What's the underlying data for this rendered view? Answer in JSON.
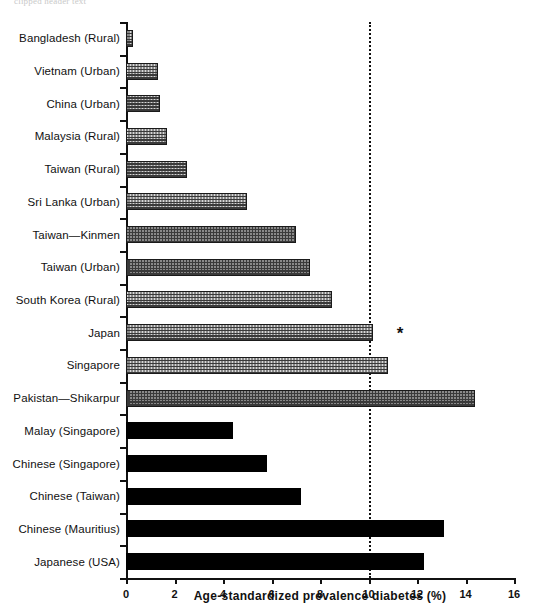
{
  "top_artifact": "clipped header text",
  "chart_data": {
    "type": "bar",
    "orientation": "horizontal",
    "title": "",
    "xlabel": "Age-standardized prevalence diabetes (%)",
    "ylabel": "",
    "xlim": [
      0,
      16
    ],
    "xticks": [
      0,
      2,
      4,
      6,
      8,
      10,
      12,
      14,
      16
    ],
    "xtick_labels": [
      "0",
      "2",
      "4",
      "6",
      "8",
      "10",
      "12",
      "14",
      "16"
    ],
    "grid": false,
    "legend": null,
    "reference_line": {
      "value": 10,
      "style": "dotted"
    },
    "annotations": [
      {
        "text": "*",
        "category": "Japan",
        "x": 11.3
      }
    ],
    "series": [
      {
        "name": "Asian countries",
        "fill": "hatched",
        "color": "#d8d8d8"
      },
      {
        "name": "Migrant / ethnic Asian populations",
        "fill": "solid",
        "color": "#000000"
      }
    ],
    "categories": [
      "Bangladesh (Rural)",
      "Vietnam (Urban)",
      "China (Urban)",
      "Malaysia (Rural)",
      "Taiwan (Rural)",
      "Sri Lanka (Urban)",
      "Taiwan—Kinmen",
      "Taiwan (Urban)",
      "South Korea (Rural)",
      "Japan",
      "Singapore",
      "Pakistan—Shikarpur",
      "Malay (Singapore)",
      "Chinese (Singapore)",
      "Chinese (Taiwan)",
      "Chinese (Mauritius)",
      "Japanese (USA)"
    ],
    "values": [
      0.3,
      1.3,
      1.4,
      1.7,
      2.5,
      5.0,
      7.0,
      7.6,
      8.5,
      10.2,
      10.8,
      14.4,
      4.4,
      5.8,
      7.2,
      13.1,
      12.3
    ],
    "bar_styles": [
      "hatched",
      "hatched",
      "hatched",
      "hatched",
      "hatched",
      "hatched",
      "hatched",
      "hatched",
      "hatched",
      "hatched",
      "hatched",
      "hatched",
      "solid",
      "solid",
      "solid",
      "solid",
      "solid"
    ],
    "bars": [
      {
        "label": "Bangladesh (Rural)",
        "value": 0.3,
        "style": "hatched"
      },
      {
        "label": "Vietnam (Urban)",
        "value": 1.3,
        "style": "hatched"
      },
      {
        "label": "China (Urban)",
        "value": 1.4,
        "style": "hatched"
      },
      {
        "label": "Malaysia (Rural)",
        "value": 1.7,
        "style": "hatched"
      },
      {
        "label": "Taiwan (Rural)",
        "value": 2.5,
        "style": "hatched"
      },
      {
        "label": "Sri Lanka (Urban)",
        "value": 5.0,
        "style": "hatched"
      },
      {
        "label": "Taiwan—Kinmen",
        "value": 7.0,
        "style": "hatched"
      },
      {
        "label": "Taiwan (Urban)",
        "value": 7.6,
        "style": "hatched"
      },
      {
        "label": "South Korea (Rural)",
        "value": 8.5,
        "style": "hatched"
      },
      {
        "label": "Japan",
        "value": 10.2,
        "style": "hatched"
      },
      {
        "label": "Singapore",
        "value": 10.8,
        "style": "hatched"
      },
      {
        "label": "Pakistan—Shikarpur",
        "value": 14.4,
        "style": "hatched"
      },
      {
        "label": "Malay (Singapore)",
        "value": 4.4,
        "style": "solid"
      },
      {
        "label": "Chinese (Singapore)",
        "value": 5.8,
        "style": "solid"
      },
      {
        "label": "Chinese (Taiwan)",
        "value": 7.2,
        "style": "solid"
      },
      {
        "label": "Chinese (Mauritius)",
        "value": 13.1,
        "style": "solid"
      },
      {
        "label": "Japanese (USA)",
        "value": 12.3,
        "style": "solid"
      }
    ]
  }
}
